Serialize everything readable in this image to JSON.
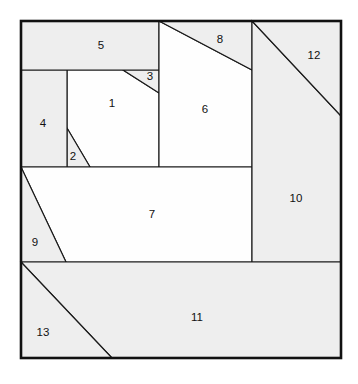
{
  "figure": {
    "kind": "geometric-dissection-diagram",
    "canvas": {
      "width": 358,
      "height": 384
    },
    "frame": {
      "x": 21,
      "y": 21,
      "width": 320,
      "height": 337
    },
    "colors": {
      "background": "#ffffff",
      "shaded_fill": "#eeeeee",
      "plain_fill": "#fefefe",
      "line": "#1a1a1a",
      "frame_line": "#111111",
      "label_text": "#111111"
    },
    "region_count": 13,
    "regions": [
      {
        "id": 1,
        "label": "1",
        "style": "plain",
        "label_x": 112,
        "label_y": 104,
        "points": "67,70 123,70 159,93 159,167 90,167 67,128"
      },
      {
        "id": 2,
        "label": "2",
        "style": "shaded",
        "label_x": 73,
        "label_y": 157,
        "points": "67,128 90,167 67,167"
      },
      {
        "id": 3,
        "label": "3",
        "style": "shaded",
        "label_x": 150,
        "label_y": 77,
        "points": "123,70 159,70 159,93"
      },
      {
        "id": 4,
        "label": "4",
        "style": "shaded",
        "label_x": 43,
        "label_y": 124,
        "points": "21,70 67,70 67,167 21,167"
      },
      {
        "id": 5,
        "label": "5",
        "style": "shaded",
        "label_x": 101,
        "label_y": 46,
        "points": "21,21 159,21 159,70 21,70"
      },
      {
        "id": 6,
        "label": "6",
        "style": "plain",
        "label_x": 205,
        "label_y": 110,
        "points": "159,21 252,70 252,167 159,167"
      },
      {
        "id": 7,
        "label": "7",
        "style": "plain",
        "label_x": 152,
        "label_y": 215,
        "points": "21,167 252,167 252,262 66,262"
      },
      {
        "id": 8,
        "label": "8",
        "style": "shaded",
        "label_x": 220,
        "label_y": 40,
        "points": "159,21 252,21 252,70"
      },
      {
        "id": 9,
        "label": "9",
        "style": "shaded",
        "label_x": 35,
        "label_y": 243,
        "points": "21,167 66,262 21,262"
      },
      {
        "id": 10,
        "label": "10",
        "style": "shaded",
        "label_x": 296,
        "label_y": 199,
        "points": "252,21 341,116 341,262 252,262"
      },
      {
        "id": 11,
        "label": "11",
        "style": "shaded",
        "label_x": 197,
        "label_y": 318,
        "points": "21,262 341,262 341,358 112,358"
      },
      {
        "id": 12,
        "label": "12",
        "style": "shaded",
        "label_x": 314,
        "label_y": 56,
        "points": "252,21 341,21 341,116"
      },
      {
        "id": 13,
        "label": "13",
        "style": "shaded",
        "label_x": 43,
        "label_y": 333,
        "points": "21,262 112,358 21,358"
      }
    ]
  },
  "chart_data": {
    "type": "diagram",
    "title": "",
    "subtitle": "",
    "xlabel": "",
    "ylabel": "",
    "annotations": [
      "1",
      "2",
      "3",
      "4",
      "5",
      "6",
      "7",
      "8",
      "9",
      "10",
      "11",
      "12",
      "13"
    ],
    "legend": [],
    "grid": false
  }
}
